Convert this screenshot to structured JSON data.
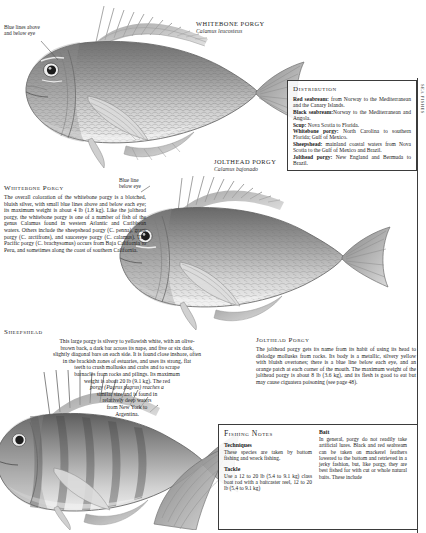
{
  "page": {
    "background": "#ffffff",
    "ink": "#1a1a1a"
  },
  "callouts": [
    {
      "name": "blue-line-above-below-eye",
      "text": "Blue lines above and below eye"
    },
    {
      "name": "blue-line-below-eye",
      "text": "Blue line below eye"
    }
  ],
  "plate_titles": [
    {
      "common": "WHITEBONE PORGY",
      "scientific": "Calamus leucosteus"
    },
    {
      "common": "JOLTHEAD PORGY",
      "scientific": "Calamus bajonado"
    }
  ],
  "distribution": {
    "heading": "Distribution",
    "entries": [
      {
        "species": "Red seabream:",
        "range": " from Norway to the Mediterranean and the Canary Islands."
      },
      {
        "species": "Black seabream:",
        "range": "Norway to the Mediterranean and Angola."
      },
      {
        "species": "Scup:",
        "range": " Nova Scotia to Florida."
      },
      {
        "species": "Whitebone porgy:",
        "range": " North Carolina to southern Florida; Gulf of Mexico."
      },
      {
        "species": "Sheepshead:",
        "range": " mainland coastal waters from Nova Scotia to the Gulf of Mexico and Brazil."
      },
      {
        "species": "Jolthead porgy:",
        "range": " New England and Bermuda to Brazil."
      }
    ]
  },
  "whitebone": {
    "heading": "Whitebone Porgy",
    "paragraph": "The overall coloration of the whitebone porgy is a blotched, bluish silver, with small blue lines above and below each eye; its maximum weight is about 4 lb (1.8 kg). Like the jolthead porgy, the whitebone porgy is one of a number of fish of the genus Calamus found in western Atlantic and Caribbean waters. Others include the sheepshead porgy (C. penna), grass porgy (C. arctifrons), and saucereye porgy (C. calamus). The Pacific porgy (C. brachysomus) occurs from Baja California to Peru, and sometimes along the coast of southern California."
  },
  "sheepshead": {
    "heading": "Sheepshead",
    "lines": [
      "This large porgy is silvery to yellowish white, with an olive-",
      "brown back, a dark bar across its nape, and five or six dark,",
      "slightly diagonal bars on each side. It is found close inshore, often",
      "in the brackish zones of estuaries, and uses its strong, flat",
      "teeth to crush mollusks and crabs and to scrape",
      "barnacles from rocks and pilings. Its maximum",
      "weight is about 20 lb (9.1 kg). The red",
      "porgy (Pagrus pagrus) reaches a",
      "similar size and is found in",
      "relatively deep waters",
      "from New York to",
      "Argentina."
    ]
  },
  "jolthead": {
    "heading": "Jolthead Porgy",
    "paragraph": "The jolthead porgy gets its name from its habit of using its head to dislodge mollusks from rocks. Its body is a metallic, silvery yellow with bluish overtones; there is a blue line below each eye, and an orange patch at each corner of the mouth. The maximum weight of the jolthead porgy is about 8 lb (3.6 kg), and its flesh is good to eat but may cause ciguatera poisoning (see page 48)."
  },
  "fishing_notes": {
    "heading": "Fishing Notes",
    "columns": [
      {
        "sections": [
          {
            "title": "Techniques",
            "text": "These species are taken by bottom fishing and wreck fishing."
          },
          {
            "title": "Tackle",
            "text": "Use a 12 to 20 lb (5.4 to 9.1 kg) class boat rod with a baitcaster reel, 12 to 20 lb (5.4 to 9.1 kg)"
          }
        ]
      },
      {
        "sections": [
          {
            "title": "Bait",
            "text": "In general, porgy do not readily take artificial lures. Black and red seabream can be taken on mackerel feathers lowered to the bottom and retrieved in a jerky fashion, but, like porgy, they are best fished for with cut or whole natural baits. These include"
          }
        ]
      }
    ]
  },
  "side_tab": {
    "label": "SEA FISHES"
  }
}
